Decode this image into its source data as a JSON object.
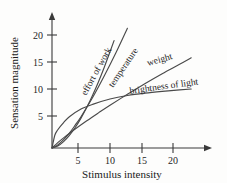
{
  "chart_data": {
    "type": "line",
    "title": "",
    "xlabel": "Stimulus intensity",
    "ylabel": "Sensation magnitude",
    "xlim": [
      0,
      24
    ],
    "ylim": [
      0,
      23
    ],
    "xticks": [
      5,
      10,
      15,
      20
    ],
    "yticks": [
      5,
      10,
      15,
      20
    ],
    "xtick_labels": [
      "5",
      "10",
      "15",
      "20"
    ],
    "ytick_labels": [
      "5",
      "10",
      "15",
      "20"
    ],
    "grid": false,
    "legend_position": "inline-curve-labels",
    "annotation_note": "Stevens power law: each curve labeled along its path",
    "series": [
      {
        "name": "effort of work",
        "label": "effort of work",
        "exponent": 1.7,
        "x": [
          0,
          1,
          2,
          3,
          4,
          5,
          6,
          7,
          8,
          9,
          10,
          10.7
        ],
        "y": [
          0,
          0.33,
          1.07,
          2.13,
          3.47,
          5.07,
          6.9,
          8.95,
          11.2,
          13.65,
          16.3,
          18.2
        ]
      },
      {
        "name": "temperature",
        "label": "temperature",
        "exponent": 1.45,
        "x": [
          0,
          1,
          2,
          3,
          4,
          5,
          7,
          9,
          11,
          13,
          15,
          16.5
        ],
        "y": [
          0,
          0.52,
          1.42,
          2.52,
          3.87,
          5.3,
          8.55,
          12.2,
          16.1,
          20.3,
          24.6,
          27.9
        ]
      },
      {
        "name": "weight",
        "label": "weight",
        "exponent": 0.9,
        "x": [
          0,
          1,
          2,
          4,
          6,
          8,
          10,
          13,
          16,
          19,
          22,
          24
        ],
        "y": [
          0,
          0.92,
          1.72,
          3.22,
          4.62,
          5.95,
          7.25,
          9.1,
          10.9,
          12.6,
          14.2,
          15.3
        ]
      },
      {
        "name": "brightness of light",
        "label": "brightness of light",
        "exponent": 0.33,
        "x": [
          0,
          0.5,
          1,
          2,
          3,
          5,
          7,
          10,
          13,
          16,
          19,
          22,
          24
        ],
        "y": [
          0,
          2.2,
          3.1,
          4.3,
          5.3,
          6.6,
          7.4,
          8.3,
          8.9,
          9.3,
          9.6,
          9.85,
          10.0
        ]
      }
    ]
  },
  "axes": {
    "y_axis_title": "Sensation magnitude",
    "x_axis_title": "Stimulus intensity",
    "x_ticks": [
      {
        "label": "5"
      },
      {
        "label": "10"
      },
      {
        "label": "15"
      },
      {
        "label": "20"
      }
    ],
    "y_ticks": [
      {
        "label": "20"
      },
      {
        "label": "15"
      },
      {
        "label": "10"
      },
      {
        "label": "5"
      }
    ]
  },
  "curve_labels": {
    "effort_of_work": "effort of work",
    "temperature": "temperature",
    "weight": "weight",
    "brightness_of_light": "brightness of light"
  },
  "colors": {
    "background": "#fdfdfc",
    "axis": "#3a3a3a",
    "curve": "#4a4a4a",
    "text": "#1a1a1a"
  }
}
